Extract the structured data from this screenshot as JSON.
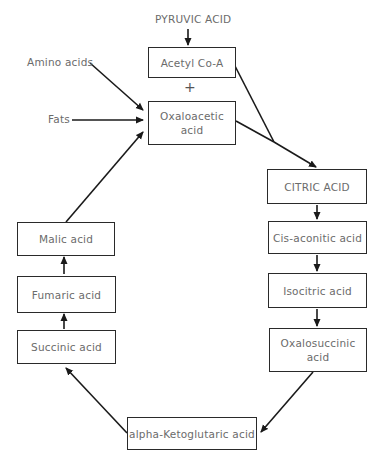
{
  "diagram": {
    "type": "flowchart",
    "inputs": {
      "pyruvic": "PYRUVIC ACID",
      "amino": "Amino acids",
      "fats": "Fats",
      "plus": "+"
    },
    "nodes": {
      "acetyl": "Acetyl Co-A",
      "oxaloacetic_l1": "Oxaloacetic",
      "oxaloacetic_l2": "acid",
      "citric": "CITRIC ACID",
      "cisaconitic": "Cis-aconitic acid",
      "isocitric": "Isocitric acid",
      "oxalosuccinic_l1": "Oxalosuccinic",
      "oxalosuccinic_l2": "acid",
      "ketoglutaric": "alpha-Ketoglutaric acid",
      "succinic": "Succinic acid",
      "fumaric": "Fumaric acid",
      "malic": "Malic acid"
    },
    "edges": [
      [
        "PYRUVIC ACID",
        "Acetyl Co-A"
      ],
      [
        "Amino acids",
        "Oxaloacetic acid"
      ],
      [
        "Fats",
        "Oxaloacetic acid"
      ],
      [
        "Acetyl Co-A",
        "CITRIC ACID"
      ],
      [
        "Oxaloacetic acid",
        "CITRIC ACID"
      ],
      [
        "CITRIC ACID",
        "Cis-aconitic acid"
      ],
      [
        "Cis-aconitic acid",
        "Isocitric acid"
      ],
      [
        "Isocitric acid",
        "Oxalosuccinic acid"
      ],
      [
        "Oxalosuccinic acid",
        "alpha-Ketoglutaric acid"
      ],
      [
        "alpha-Ketoglutaric acid",
        "Succinic acid"
      ],
      [
        "Succinic acid",
        "Fumaric acid"
      ],
      [
        "Fumaric acid",
        "Malic acid"
      ],
      [
        "Malic acid",
        "Oxaloacetic acid"
      ]
    ],
    "colors": {
      "line": "#1a1a1a",
      "text": "#6b6b6b",
      "background": "#ffffff"
    }
  }
}
